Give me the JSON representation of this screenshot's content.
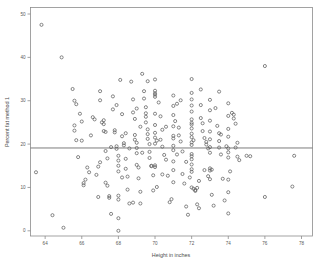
{
  "chart_data": {
    "type": "scatter",
    "title": "",
    "xlabel": "Height in inches",
    "ylabel": "Percent fat method 1",
    "xlim": [
      63.2,
      78.6
    ],
    "ylim": [
      -1.2,
      51.5
    ],
    "xticks": [
      64,
      66,
      68,
      70,
      72,
      74,
      76,
      78
    ],
    "yticks": [
      0,
      10,
      20,
      30,
      40,
      50
    ],
    "grid": false,
    "legend": null,
    "marker": "open-circle",
    "marker_color": "#5f5f5f",
    "reference_lines": [
      {
        "orientation": "horizontal",
        "value": 19.1,
        "color": "#6e6e6e",
        "label": ""
      }
    ],
    "points": [
      [
        63.8,
        47.5
      ],
      [
        64.9,
        40.0
      ],
      [
        63.5,
        13.5
      ],
      [
        64.4,
        3.6
      ],
      [
        65.0,
        0.7
      ],
      [
        65.5,
        32.7
      ],
      [
        65.6,
        30.0
      ],
      [
        65.7,
        29.2
      ],
      [
        65.6,
        23.1
      ],
      [
        65.6,
        24.3
      ],
      [
        65.8,
        17.0
      ],
      [
        66.0,
        25.2
      ],
      [
        66.0,
        20.8
      ],
      [
        66.1,
        11.0
      ],
      [
        66.1,
        10.5
      ],
      [
        66.2,
        11.8
      ],
      [
        66.4,
        13.5
      ],
      [
        66.6,
        26.2
      ],
      [
        66.7,
        25.7
      ],
      [
        66.8,
        12.9
      ],
      [
        66.9,
        14.8
      ],
      [
        67.0,
        32.2
      ],
      [
        67.0,
        30.1
      ],
      [
        67.1,
        25.0
      ],
      [
        67.2,
        25.5
      ],
      [
        67.2,
        24.6
      ],
      [
        67.2,
        23.0
      ],
      [
        67.3,
        22.8
      ],
      [
        67.3,
        18.4
      ],
      [
        67.3,
        11.1
      ],
      [
        67.4,
        10.4
      ],
      [
        67.5,
        8.0
      ],
      [
        67.5,
        7.6
      ],
      [
        67.6,
        3.9
      ],
      [
        67.7,
        31.0
      ],
      [
        67.7,
        28.0
      ],
      [
        67.8,
        23.2
      ],
      [
        67.8,
        22.7
      ],
      [
        67.9,
        19.5
      ],
      [
        67.9,
        18.9
      ],
      [
        68.0,
        17.3
      ],
      [
        68.0,
        16.2
      ],
      [
        68.0,
        15.0
      ],
      [
        68.0,
        13.7
      ],
      [
        68.0,
        8.1
      ],
      [
        68.0,
        7.2
      ],
      [
        68.0,
        2.9
      ],
      [
        68.0,
        0.0
      ],
      [
        68.1,
        34.8
      ],
      [
        68.2,
        26.9
      ],
      [
        68.2,
        21.8
      ],
      [
        68.3,
        20.2
      ],
      [
        68.3,
        19.7
      ],
      [
        68.4,
        16.6
      ],
      [
        68.4,
        14.3
      ],
      [
        68.5,
        12.5
      ],
      [
        68.5,
        9.5
      ],
      [
        68.6,
        6.3
      ],
      [
        68.7,
        34.4
      ],
      [
        68.8,
        30.3
      ],
      [
        68.8,
        27.3
      ],
      [
        68.9,
        22.1
      ],
      [
        68.9,
        21.0
      ],
      [
        69.0,
        20.3
      ],
      [
        69.0,
        19.1
      ],
      [
        69.0,
        17.9
      ],
      [
        69.0,
        15.2
      ],
      [
        69.1,
        14.6
      ],
      [
        69.1,
        12.1
      ],
      [
        69.2,
        9.0
      ],
      [
        69.2,
        6.3
      ],
      [
        69.3,
        36.2
      ],
      [
        69.4,
        32.2
      ],
      [
        69.4,
        30.5
      ],
      [
        69.5,
        28.5
      ],
      [
        69.5,
        27.1
      ],
      [
        69.5,
        26.3
      ],
      [
        69.5,
        25.0
      ],
      [
        69.6,
        23.4
      ],
      [
        69.6,
        22.3
      ],
      [
        69.6,
        21.2
      ],
      [
        69.7,
        20.0
      ],
      [
        69.7,
        18.2
      ],
      [
        69.7,
        16.8
      ],
      [
        69.8,
        15.0
      ],
      [
        69.8,
        14.9
      ],
      [
        69.9,
        12.8
      ],
      [
        70.0,
        34.9
      ],
      [
        70.0,
        32.3
      ],
      [
        70.0,
        31.7
      ],
      [
        70.0,
        31.4
      ],
      [
        70.0,
        30.9
      ],
      [
        70.0,
        27.0
      ],
      [
        70.0,
        24.4
      ],
      [
        70.0,
        22.6
      ],
      [
        70.0,
        21.5
      ],
      [
        70.0,
        20.1
      ],
      [
        70.0,
        15.1
      ],
      [
        70.0,
        14.7
      ],
      [
        70.1,
        10.1
      ],
      [
        70.2,
        29.6
      ],
      [
        70.3,
        26.4
      ],
      [
        70.4,
        23.3
      ],
      [
        70.4,
        19.4
      ],
      [
        70.5,
        17.5
      ],
      [
        70.6,
        16.4
      ],
      [
        70.7,
        12.7
      ],
      [
        70.8,
        6.6
      ],
      [
        71.0,
        31.2
      ],
      [
        71.0,
        28.8
      ],
      [
        71.0,
        26.7
      ],
      [
        71.0,
        24.1
      ],
      [
        71.0,
        21.9
      ],
      [
        71.0,
        21.3
      ],
      [
        71.0,
        19.6
      ],
      [
        71.0,
        18.6
      ],
      [
        71.0,
        16.0
      ],
      [
        71.0,
        14.0
      ],
      [
        71.0,
        11.2
      ],
      [
        71.2,
        29.3
      ],
      [
        71.3,
        23.8
      ],
      [
        71.3,
        22.0
      ],
      [
        71.4,
        20.6
      ],
      [
        71.5,
        18.3
      ],
      [
        71.5,
        13.1
      ],
      [
        71.6,
        10.9
      ],
      [
        71.7,
        5.6
      ],
      [
        71.8,
        3.7
      ],
      [
        72.0,
        35.0
      ],
      [
        72.0,
        31.8
      ],
      [
        72.0,
        30.3
      ],
      [
        72.0,
        28.9
      ],
      [
        72.0,
        27.5
      ],
      [
        72.0,
        25.7
      ],
      [
        72.0,
        24.9
      ],
      [
        72.0,
        24.5
      ],
      [
        72.0,
        23.6
      ],
      [
        72.0,
        22.4
      ],
      [
        72.0,
        21.6
      ],
      [
        72.0,
        20.4
      ],
      [
        72.0,
        19.8
      ],
      [
        72.0,
        17.7
      ],
      [
        72.0,
        17.2
      ],
      [
        72.0,
        16.5
      ],
      [
        72.0,
        15.3
      ],
      [
        72.0,
        14.2
      ],
      [
        72.0,
        13.6
      ],
      [
        72.0,
        10.0
      ],
      [
        72.1,
        9.7
      ],
      [
        72.2,
        9.4
      ],
      [
        72.2,
        9.2
      ],
      [
        72.3,
        9.9
      ],
      [
        72.3,
        6.1
      ],
      [
        72.4,
        5.2
      ],
      [
        72.5,
        32.6
      ],
      [
        72.5,
        29.0
      ],
      [
        72.5,
        26.0
      ],
      [
        72.6,
        24.8
      ],
      [
        72.6,
        23.0
      ],
      [
        72.7,
        21.4
      ],
      [
        72.8,
        20.5
      ],
      [
        72.8,
        19.9
      ],
      [
        72.9,
        19.0
      ],
      [
        73.0,
        30.2
      ],
      [
        73.0,
        27.8
      ],
      [
        73.0,
        25.4
      ],
      [
        73.0,
        22.9
      ],
      [
        73.0,
        21.1
      ],
      [
        73.0,
        19.3
      ],
      [
        73.0,
        18.0
      ],
      [
        73.0,
        14.4
      ],
      [
        73.0,
        13.9
      ],
      [
        73.0,
        11.9
      ],
      [
        73.1,
        8.3
      ],
      [
        73.2,
        5.8
      ],
      [
        73.3,
        28.3
      ],
      [
        73.4,
        24.2
      ],
      [
        73.5,
        32.1
      ],
      [
        73.5,
        22.5
      ],
      [
        73.5,
        20.7
      ],
      [
        73.5,
        19.2
      ],
      [
        73.6,
        17.6
      ],
      [
        73.7,
        12.0
      ],
      [
        73.8,
        7.0
      ],
      [
        74.0,
        29.4
      ],
      [
        74.0,
        26.5
      ],
      [
        74.0,
        23.5
      ],
      [
        74.0,
        21.7
      ],
      [
        74.0,
        19.0
      ],
      [
        74.0,
        18.1
      ],
      [
        74.0,
        16.9
      ],
      [
        74.0,
        11.8
      ],
      [
        74.0,
        8.9
      ],
      [
        74.0,
        4.0
      ],
      [
        74.2,
        27.2
      ],
      [
        74.3,
        26.8
      ],
      [
        74.3,
        25.9
      ],
      [
        74.4,
        24.7
      ],
      [
        74.5,
        20.3
      ],
      [
        74.5,
        17.1
      ],
      [
        74.6,
        16.3
      ],
      [
        75.0,
        17.3
      ],
      [
        75.2,
        17.2
      ],
      [
        76.0,
        38.0
      ],
      [
        76.0,
        7.8
      ],
      [
        77.5,
        10.2
      ],
      [
        77.6,
        17.3
      ],
      [
        66.5,
        22.0
      ],
      [
        67.0,
        15.8
      ],
      [
        68.9,
        25.8
      ],
      [
        69.2,
        24.0
      ],
      [
        70.3,
        21.0
      ],
      [
        71.1,
        25.3
      ],
      [
        71.9,
        12.3
      ],
      [
        72.7,
        14.0
      ],
      [
        73.1,
        14.1
      ],
      [
        69.0,
        28.2
      ],
      [
        70.6,
        24.0
      ],
      [
        68.6,
        19.0
      ],
      [
        67.6,
        19.3
      ],
      [
        66.3,
        14.6
      ],
      [
        68.2,
        12.3
      ],
      [
        69.9,
        9.3
      ],
      [
        70.9,
        7.3
      ],
      [
        72.4,
        11.5
      ],
      [
        74.1,
        13.7
      ],
      [
        65.9,
        27.0
      ],
      [
        67.9,
        29.0
      ],
      [
        71.4,
        30.1
      ],
      [
        73.6,
        22.2
      ],
      [
        68.4,
        22.5
      ],
      [
        70.1,
        20.8
      ],
      [
        72.1,
        20.9
      ],
      [
        69.3,
        18.0
      ],
      [
        67.4,
        16.7
      ],
      [
        71.7,
        15.9
      ],
      [
        73.9,
        19.5
      ],
      [
        66.9,
        7.8
      ],
      [
        68.8,
        6.5
      ],
      [
        70.4,
        13.0
      ],
      [
        72.9,
        12.6
      ],
      [
        65.7,
        20.9
      ],
      [
        69.6,
        34.5
      ],
      [
        71.2,
        17.6
      ],
      [
        74.4,
        19.2
      ]
    ]
  }
}
